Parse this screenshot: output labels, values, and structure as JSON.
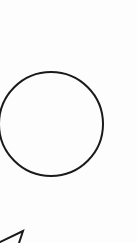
{
  "diagram": {
    "background": "#fdfdfd",
    "stroke_color": "#1a1a1a",
    "shapes": [
      {
        "type": "circle",
        "name": "circle",
        "cx": 51,
        "cy": 124,
        "r": 52,
        "stroke_width": 2
      },
      {
        "type": "triangle-partial",
        "name": "triangle",
        "points": "-2,243 23,231 19,243",
        "stroke_width": 2
      }
    ]
  }
}
